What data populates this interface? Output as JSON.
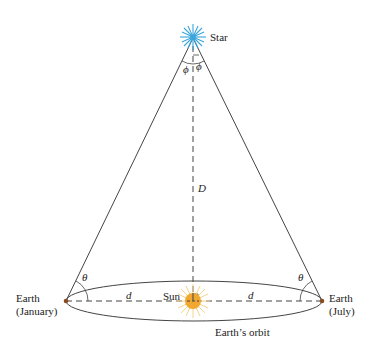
{
  "diagram": {
    "labels": {
      "star": "Star",
      "sun": "Sun",
      "distance_star": "D",
      "distance_orbit_left": "d",
      "distance_orbit_right": "d",
      "earth_january_line1": "Earth",
      "earth_january_line2": "(January)",
      "earth_july_line1": "Earth",
      "earth_july_line2": "(July)",
      "orbit": "Earth’s orbit",
      "angle_theta_left": "θ",
      "angle_theta_right": "θ",
      "angle_phi_left": "ϕ",
      "angle_phi_right": "ϕ"
    },
    "colors": {
      "star": "#3aa6dc",
      "sun": "#f0a830",
      "sun_rays": "#f6d48a",
      "earth": "#8a4a20",
      "lines": "#333333"
    }
  }
}
